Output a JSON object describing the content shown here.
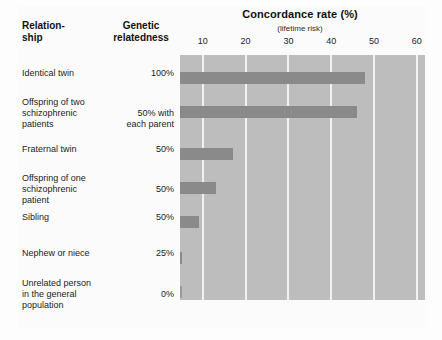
{
  "header": {
    "title": "Concordance rate (%)",
    "subtitle": "(lifetime risk)",
    "col_relationship": "Relation-\nship",
    "col_relationship_line1": "Relation-",
    "col_relationship_line2": "ship",
    "col_genetic_line1": "Genetic",
    "col_genetic_line2": "relatedness"
  },
  "colors": {
    "plot_background": "#bdbdbd",
    "bar_fill": "#8a8a8a",
    "gridline": "#f2f2f2",
    "page_background": "#fbfbfb",
    "text": "#1b1b1b"
  },
  "chart_data": {
    "type": "bar",
    "orientation": "horizontal",
    "title": "Concordance rate (%)",
    "subtitle": "(lifetime risk)",
    "xlabel": "Concordance rate (%)",
    "ylabel": "Relationship",
    "xlim": [
      0,
      65
    ],
    "ticks": [
      10,
      20,
      30,
      40,
      50,
      60
    ],
    "grid": true,
    "legend": "none",
    "categories": [
      "Identical twin",
      "Offspring of two schizophrenic patients",
      "Fraternal twin",
      "Offspring of one schizophrenic patient",
      "Sibling",
      "Nephew or niece",
      "Unrelated person in the general population"
    ],
    "genetic_relatedness": [
      "100%",
      "50% with each parent",
      "50%",
      "50%",
      "50%",
      "25%",
      "0%"
    ],
    "values": [
      48,
      46,
      17,
      13,
      9,
      4,
      1
    ]
  },
  "rows": [
    {
      "name_lines": [
        "Identical twin"
      ],
      "genetic_lines": [
        "100%"
      ],
      "value": 48
    },
    {
      "name_lines": [
        "Offspring of two",
        "schizophrenic",
        "patients"
      ],
      "genetic_lines": [
        "50% with",
        "each parent"
      ],
      "value": 46
    },
    {
      "name_lines": [
        "Fraternal twin"
      ],
      "genetic_lines": [
        "50%"
      ],
      "value": 17
    },
    {
      "name_lines": [
        "Offspring of one",
        "schizophrenic",
        "patient"
      ],
      "genetic_lines": [
        "50%"
      ],
      "value": 13
    },
    {
      "name_lines": [
        "Sibling"
      ],
      "genetic_lines": [
        "50%"
      ],
      "value": 9
    },
    {
      "name_lines": [
        "Nephew or niece"
      ],
      "genetic_lines": [
        "25%"
      ],
      "value": 4
    },
    {
      "name_lines": [
        "Unrelated person",
        "in the general",
        "population"
      ],
      "genetic_lines": [
        "0%"
      ],
      "value": 1
    }
  ]
}
